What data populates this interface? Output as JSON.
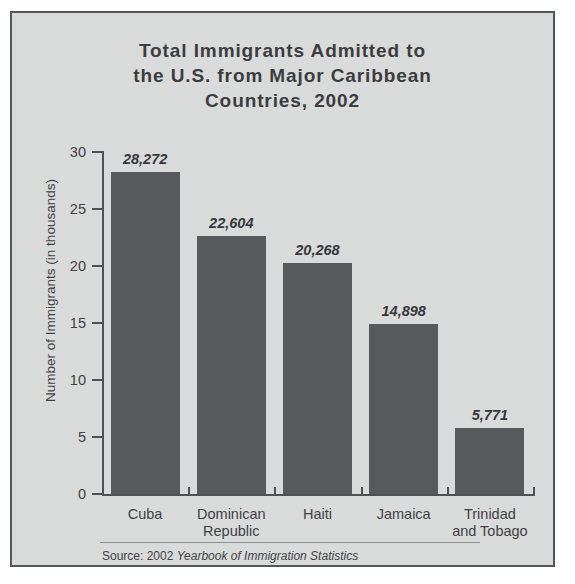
{
  "figure": {
    "background_color": "#d9dada",
    "border_color": "#54565a",
    "bar_color": "#58595b",
    "text_color": "#3f4144"
  },
  "title": {
    "line1": "Total Immigrants Admitted to",
    "line2": "the U.S. from Major Caribbean",
    "line3": "Countries, 2002"
  },
  "source": {
    "prefix": "Source: 2002 ",
    "publication": "Yearbook of Immigration Statistics"
  },
  "chart_data": {
    "type": "bar",
    "title": "Total Immigrants Admitted to the U.S. from Major Caribbean Countries, 2002",
    "xlabel": "",
    "ylabel": "Number of Immigrants (in thousands)",
    "categories": [
      "Cuba",
      "Dominican\nRepublic",
      "Haiti",
      "Jamaica",
      "Trinidad\nand Tobago"
    ],
    "values": [
      28.272,
      22.604,
      20.268,
      14.898,
      5.771
    ],
    "value_labels": [
      "28,272",
      "22,604",
      "20,268",
      "14,898",
      "5,771"
    ],
    "ylim": [
      0,
      30
    ],
    "yticks": [
      0,
      5,
      10,
      15,
      20,
      25,
      30
    ],
    "ytick_labels": [
      "0",
      "5",
      "10",
      "15",
      "20",
      "25",
      "30"
    ],
    "grid": false,
    "legend": null,
    "units": "thousands"
  }
}
